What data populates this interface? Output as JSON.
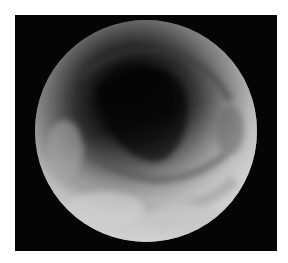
{
  "image": {
    "description": "Grayscale endoscopic view of a tubular lumen within a circular field of view on a black background",
    "colors": {
      "border": "#ffffff",
      "background": "#050505",
      "lumen": "#050505",
      "mucosa_light": "#c8c8c8",
      "mucosa_mid": "#7a7a7a"
    }
  }
}
